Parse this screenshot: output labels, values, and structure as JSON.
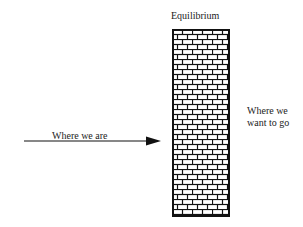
{
  "diagram": {
    "title": "Equilibrium",
    "left_label": "Where we are",
    "right_label_line1": "Where we",
    "right_label_line2": "want to go",
    "wall": {
      "type": "brick-wall",
      "rows": 37,
      "color": "#111111"
    },
    "arrow": {
      "direction": "right",
      "color": "#111111"
    }
  }
}
